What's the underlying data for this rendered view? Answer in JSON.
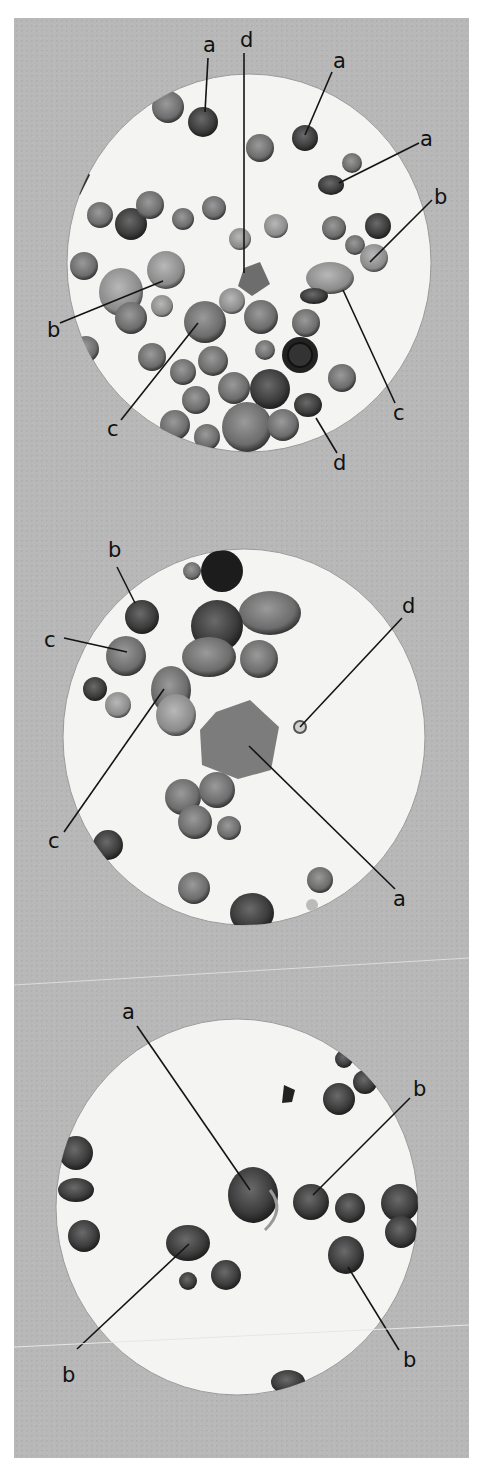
{
  "figure": {
    "colors": {
      "plate_background": "#b8b8b8",
      "field_background": "#f4f4f2",
      "cell_dark": "#3a3a3a",
      "cell_mid": "#6e6e6e",
      "label": "#111111"
    },
    "panels": [
      {
        "id": "panel-1",
        "field": {
          "cx": 249,
          "cy": 263,
          "rx": 182,
          "ry": 189
        },
        "labels": [
          {
            "text": "a",
            "x": 203,
            "y": 52,
            "line": [
              208,
              58,
              205,
              112
            ]
          },
          {
            "text": "d",
            "x": 240,
            "y": 47,
            "line": [
              244,
              53,
              244,
              273
            ]
          },
          {
            "text": "a",
            "x": 333,
            "y": 68,
            "line": [
              332,
              72,
              305,
              135
            ]
          },
          {
            "text": "a",
            "x": 420,
            "y": 146,
            "line": [
              419,
              143,
              339,
              183
            ]
          },
          {
            "text": "b",
            "x": 434,
            "y": 204,
            "line": [
              432,
              200,
              370,
              262
            ]
          },
          {
            "text": "b",
            "x": 47,
            "y": 337,
            "line": [
              60,
              323,
              163,
              281
            ]
          },
          {
            "text": "c",
            "x": 107,
            "y": 436,
            "line": [
              121,
              420,
              198,
              323
            ]
          },
          {
            "text": "c",
            "x": 393,
            "y": 420,
            "line": [
              395,
              403,
              343,
              290
            ]
          },
          {
            "text": "d",
            "x": 333,
            "y": 470,
            "line": [
              337,
              453,
              316,
              418
            ]
          }
        ]
      },
      {
        "id": "panel-2",
        "field": {
          "cx": 244,
          "cy": 737,
          "rx": 181,
          "ry": 188
        },
        "labels": [
          {
            "text": "b",
            "x": 108,
            "y": 557,
            "line": [
              117,
              567,
              135,
              603
            ]
          },
          {
            "text": "c",
            "x": 44,
            "y": 647,
            "line": [
              64,
              638,
              127,
              652
            ]
          },
          {
            "text": "d",
            "x": 402,
            "y": 613,
            "line": [
              402,
              618,
              300,
              727
            ]
          },
          {
            "text": "c",
            "x": 48,
            "y": 848,
            "line": [
              64,
              832,
              164,
              689
            ]
          },
          {
            "text": "a",
            "x": 393,
            "y": 906,
            "line": [
              395,
              889,
              249,
              746
            ]
          }
        ]
      },
      {
        "id": "panel-3",
        "field": {
          "cx": 237,
          "cy": 1207,
          "rx": 181,
          "ry": 188
        },
        "labels": [
          {
            "text": "a",
            "x": 122,
            "y": 1019,
            "line": [
              137,
              1026,
              250,
              1190
            ]
          },
          {
            "text": "b",
            "x": 413,
            "y": 1096,
            "line": [
              410,
              1098,
              313,
              1195
            ]
          },
          {
            "text": "b",
            "x": 62,
            "y": 1382,
            "line": [
              77,
              1349,
              189,
              1244
            ]
          },
          {
            "text": "b",
            "x": 403,
            "y": 1367,
            "line": [
              399,
              1350,
              348,
              1267
            ]
          }
        ]
      }
    ]
  }
}
